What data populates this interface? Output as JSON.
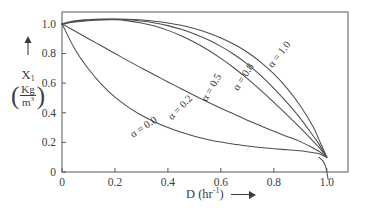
{
  "chart_data": {
    "type": "line",
    "title": "",
    "subtitle": "",
    "xlabel": "D (hr⁻¹)",
    "xlabel_base": "D (hr",
    "xlabel_exp": "-1",
    "xlabel_close": ")",
    "ylabel": "X₁",
    "ylabel_base": "X",
    "ylabel_sub": "1",
    "ylabel_units_numerator": "Kg",
    "ylabel_units_denominator": "m",
    "ylabel_units_denominator_exp": "3",
    "xlim": [
      0,
      1.08
    ],
    "ylim": [
      0,
      1.08
    ],
    "xticks": [
      0,
      0.2,
      0.4,
      0.6,
      0.8,
      1.0
    ],
    "xticklabels": [
      "0",
      "0.2",
      "0.4",
      "0.6",
      "0.8",
      "1.0"
    ],
    "yticks": [
      0,
      0.2,
      0.4,
      0.6,
      0.8,
      1.0
    ],
    "yticklabels": [
      "0",
      "0.2",
      "0.4",
      "0.6",
      "0.8",
      "1.0"
    ],
    "grid": false,
    "legend_position": "inline-annotations",
    "line_color": "#4a4d52",
    "axis_color": "#55585c",
    "text_color": "#3a3d41",
    "background": "#ffffff",
    "x": [
      0.0,
      0.05,
      0.1,
      0.15,
      0.2,
      0.25,
      0.3,
      0.35,
      0.4,
      0.45,
      0.5,
      0.55,
      0.6,
      0.65,
      0.7,
      0.75,
      0.8,
      0.85,
      0.9,
      0.95,
      0.97,
      1.0
    ],
    "series": [
      {
        "name": "α = 1.0",
        "alpha": 1.0,
        "label": "α = 1.0",
        "label_x": 0.83,
        "label_y": 0.78,
        "label_rotation": -52,
        "values": [
          1.0,
          1.02,
          1.028,
          1.032,
          1.033,
          1.031,
          1.026,
          1.018,
          1.006,
          0.99,
          0.968,
          0.94,
          0.905,
          0.862,
          0.808,
          0.742,
          0.662,
          0.565,
          0.447,
          0.3,
          0.22,
          0.1
        ]
      },
      {
        "name": "α = 0.8",
        "alpha": 0.8,
        "label": "α = 0.8",
        "label_x": 0.695,
        "label_y": 0.63,
        "label_rotation": -57,
        "values": [
          1.0,
          1.018,
          1.026,
          1.03,
          1.031,
          1.027,
          1.019,
          1.006,
          0.988,
          0.963,
          0.932,
          0.894,
          0.848,
          0.793,
          0.728,
          0.652,
          0.565,
          0.468,
          0.362,
          0.24,
          0.19,
          0.1
        ]
      },
      {
        "name": "α = 0.5",
        "alpha": 0.5,
        "label": "α = 0.5",
        "label_x": 0.575,
        "label_y": 0.56,
        "label_rotation": -60,
        "values": [
          1.0,
          1.012,
          1.021,
          1.026,
          1.027,
          1.02,
          1.006,
          0.985,
          0.956,
          0.92,
          0.876,
          0.825,
          0.767,
          0.702,
          0.63,
          0.552,
          0.47,
          0.385,
          0.298,
          0.205,
          0.168,
          0.1
        ]
      },
      {
        "name": "α = 0.2",
        "alpha": 0.2,
        "label": "α = 0.2",
        "label_x": 0.455,
        "label_y": 0.42,
        "label_rotation": -46,
        "values": [
          1.0,
          0.95,
          0.9,
          0.85,
          0.8,
          0.75,
          0.702,
          0.655,
          0.608,
          0.562,
          0.516,
          0.472,
          0.43,
          0.39,
          0.35,
          0.312,
          0.275,
          0.24,
          0.205,
          0.16,
          0.14,
          0.1
        ]
      },
      {
        "name": "α = 0.0",
        "alpha": 0.0,
        "label": "α = 0.0",
        "label_x": 0.315,
        "label_y": 0.285,
        "label_rotation": -34,
        "values": [
          1.0,
          0.825,
          0.695,
          0.59,
          0.505,
          0.438,
          0.383,
          0.338,
          0.3,
          0.268,
          0.242,
          0.22,
          0.202,
          0.188,
          0.175,
          0.165,
          0.157,
          0.15,
          0.143,
          0.13,
          0.123,
          0.1
        ]
      }
    ],
    "tail": {
      "description": "all curves merge near D=0.97 and drop vertically to zero at D=1.0",
      "x": [
        0.97,
        0.985,
        0.995,
        1.0,
        1.005
      ],
      "values": [
        0.1,
        0.075,
        0.04,
        0.0,
        -0.05
      ]
    },
    "y_axis_arrow": "up-arrow",
    "x_axis_arrow": "right-arrow"
  }
}
